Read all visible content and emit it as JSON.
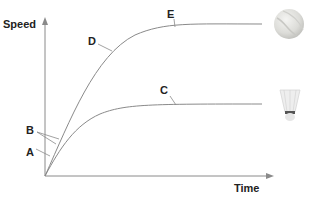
{
  "diagram": {
    "type": "speed-time graph",
    "axes": {
      "y_label": "Speed",
      "x_label": "Time"
    },
    "curves": [
      {
        "id": "upper",
        "object": "tennis-ball",
        "description": "rises steeply then levels off at high terminal speed"
      },
      {
        "id": "lower",
        "object": "shuttlecock",
        "description": "rises then levels off at lower terminal speed"
      }
    ],
    "labels": {
      "A": "A",
      "B": "B",
      "C": "C",
      "D": "D",
      "E": "E"
    },
    "icons": {
      "ball": "tennis-ball-icon",
      "shuttle": "shuttlecock-icon"
    },
    "colors": {
      "line": "#8a8a8a",
      "text": "#222222"
    }
  }
}
